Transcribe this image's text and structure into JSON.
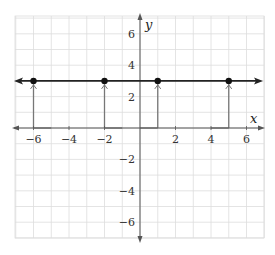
{
  "chart_data": {
    "type": "line",
    "title": "",
    "xlabel": "x",
    "ylabel": "y",
    "xlim": [
      -7,
      7
    ],
    "ylim": [
      -7,
      7
    ],
    "grid": true,
    "grid_step": 1,
    "x_ticks": [
      -6,
      -4,
      -2,
      2,
      4,
      6
    ],
    "y_ticks": [
      6,
      4,
      2,
      -2,
      -4,
      -6
    ],
    "x_tick_labels": [
      "−6",
      "−4",
      "−2",
      "2",
      "4",
      "6"
    ],
    "y_tick_labels": [
      "6",
      "4",
      "2",
      "−2",
      "−4",
      "−6"
    ],
    "horizontal_line": {
      "y": 3,
      "arrows_both_ends": true,
      "color": "#222222"
    },
    "points": [
      {
        "x": -6,
        "y": 3
      },
      {
        "x": -2,
        "y": 3
      },
      {
        "x": 1,
        "y": 3
      },
      {
        "x": 5,
        "y": 3
      }
    ],
    "vertical_segments": [
      {
        "x": -6,
        "y_from": 0,
        "y_to": 3,
        "foot_to_x": -5
      },
      {
        "x": -2,
        "y_from": 0,
        "y_to": 3,
        "foot_to_x": -1
      },
      {
        "x": 1,
        "y_from": 0,
        "y_to": 3,
        "foot_to_x": 0
      },
      {
        "x": 5,
        "y_from": 0,
        "y_to": 3,
        "foot_to_x": 4
      }
    ],
    "colors": {
      "grid": "#dddddd",
      "axes": "#555555",
      "segments": "#777777",
      "line": "#222222",
      "points": "#111111"
    }
  }
}
